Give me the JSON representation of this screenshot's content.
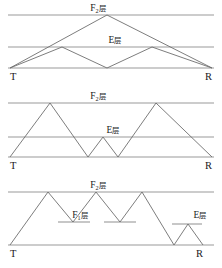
{
  "figure": {
    "type": "diagram",
    "background": "#ffffff",
    "layer_line_color": "#9a9a9a",
    "ray_color": "#6e6e6e",
    "text_color": "#1a1a1a",
    "width": 222,
    "height": 268
  },
  "labels": {
    "f2": "F",
    "f2_sub": "2",
    "f1": "F",
    "f1_sub": "1",
    "e": "E",
    "ceng": "层",
    "transmitter": "T",
    "receiver": "R"
  },
  "panels": [
    {
      "id": "panel-1",
      "name": "single-hop-f2-and-two-hop-e",
      "layers": [
        {
          "name": "F2",
          "label": "F2层",
          "y": 15,
          "x1": 8,
          "x2": 214,
          "full_width": true
        },
        {
          "name": "E",
          "label": "E层",
          "y": 47,
          "x1": 8,
          "x2": 214,
          "full_width": true
        },
        {
          "name": "ground",
          "label": "",
          "y": 68,
          "x1": 8,
          "x2": 214,
          "full_width": true
        }
      ],
      "label_positions": [
        {
          "text": "F2层",
          "x": 98,
          "y": 11,
          "kind": "f2"
        },
        {
          "text": "E层",
          "x": 115,
          "y": 43,
          "kind": "e"
        }
      ],
      "rays": [
        {
          "name": "f2-single-hop",
          "points": "10,68 107,15 212,68"
        },
        {
          "name": "e-double-hop",
          "points": "10,68 62,47 107,68 152,47 212,68"
        }
      ],
      "endpoints": [
        {
          "text": "T",
          "x": 10,
          "y": 80
        },
        {
          "text": "R",
          "x": 205,
          "y": 80
        }
      ]
    },
    {
      "id": "panel-2",
      "name": "two-hop-f2-with-intermediate-e-hop",
      "layers": [
        {
          "name": "F2",
          "label": "F2层",
          "y": 103,
          "x1": 8,
          "x2": 214,
          "full_width": true
        },
        {
          "name": "E",
          "label": "E层",
          "y": 137,
          "x1": 8,
          "x2": 214,
          "full_width": true
        },
        {
          "name": "ground",
          "label": "",
          "y": 157,
          "x1": 8,
          "x2": 214,
          "full_width": true
        }
      ],
      "label_positions": [
        {
          "text": "F2层",
          "x": 98,
          "y": 99,
          "kind": "f2"
        },
        {
          "text": "E层",
          "x": 113,
          "y": 133,
          "kind": "e"
        }
      ],
      "rays": [
        {
          "name": "mixed-f2-e-f2-path",
          "points": "10,157 50,103 88,157 103,137 118,157 156,103 212,157"
        }
      ],
      "endpoints": [
        {
          "text": "T",
          "x": 10,
          "y": 169
        },
        {
          "text": "R",
          "x": 205,
          "y": 169
        }
      ]
    },
    {
      "id": "panel-3",
      "name": "multi-hop-f2-f1-with-terminal-e-hop",
      "layers": [
        {
          "name": "F2",
          "label": "F2层",
          "y": 192,
          "x1": 8,
          "x2": 214,
          "full_width": true
        },
        {
          "name": "F1-left",
          "label": "F1层",
          "y": 222,
          "x1": 58,
          "x2": 90,
          "full_width": false
        },
        {
          "name": "F1-right",
          "label": "",
          "y": 222,
          "x1": 104,
          "x2": 136,
          "full_width": false
        },
        {
          "name": "E-right",
          "label": "E层",
          "y": 224,
          "x1": 172,
          "x2": 202,
          "full_width": false
        },
        {
          "name": "ground",
          "label": "",
          "y": 245,
          "x1": 8,
          "x2": 214,
          "full_width": true
        }
      ],
      "label_positions": [
        {
          "text": "F2层",
          "x": 98,
          "y": 188,
          "kind": "f2"
        },
        {
          "text": "F1层",
          "x": 80,
          "y": 218,
          "kind": "f1"
        },
        {
          "text": "E层",
          "x": 200,
          "y": 218,
          "kind": "e"
        }
      ],
      "rays": [
        {
          "name": "f2-f1-multi-hop-plus-e-hop",
          "points": "10,245 48,192 73,222 96,192 120,222 142,192 174,245 188,224 203,245"
        }
      ],
      "endpoints": [
        {
          "text": "T",
          "x": 10,
          "y": 257
        },
        {
          "text": "R",
          "x": 196,
          "y": 257
        }
      ]
    }
  ]
}
